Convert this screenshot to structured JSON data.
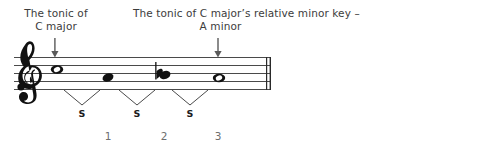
{
  "figure": {
    "type": "music-notation-diagram",
    "background_color": "#ffffff",
    "ink_color": "#1c1c1c",
    "text_color": "#3c3c3c",
    "number_color": "#6e6e6e"
  },
  "annotations": {
    "left_label": "The tonic of\nC major",
    "right_label": "The tonic of C major’s relative minor key –\nA minor",
    "left_arrow_icon": "down-arrow-icon",
    "right_arrow_icon": "down-arrow-icon"
  },
  "staff": {
    "clef": "treble-clef",
    "line_count": 5,
    "end_barline": "double-barline",
    "notes": [
      {
        "id": "note-1",
        "head": "whole-note",
        "accidental": "",
        "pitch": "C"
      },
      {
        "id": "note-2",
        "head": "filled-note",
        "accidental": "",
        "pitch": "B"
      },
      {
        "id": "note-3",
        "head": "filled-note",
        "accidental": "flat",
        "pitch": "B-flat"
      },
      {
        "id": "note-4",
        "head": "whole-note",
        "accidental": "",
        "pitch": "A"
      }
    ]
  },
  "intervals": {
    "bracket_icon": "v-bracket-icon",
    "items": [
      {
        "label": "S"
      },
      {
        "label": "S"
      },
      {
        "label": "S"
      }
    ]
  },
  "steps": {
    "numbers": [
      "1",
      "2",
      "3"
    ]
  }
}
